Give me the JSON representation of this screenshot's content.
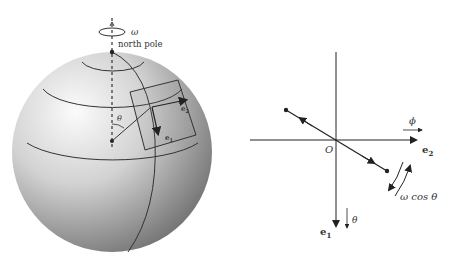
{
  "left_panel": {
    "rotation_label": "ω",
    "north_pole_label": "north pole",
    "theta_label": "θ",
    "e1_label": "e",
    "e1_sub": "1",
    "e2_label": "e",
    "e2_sub": "2"
  },
  "right_panel": {
    "origin_label": "O",
    "phi_label": "ϕ",
    "e2_label": "e",
    "e2_sub": "2",
    "e1_label": "e",
    "e1_sub": "1",
    "theta_label": "θ",
    "omega_cos_label": "ω cos θ"
  },
  "colors": {
    "stroke": "#222222",
    "sphere_light": "#f4f4f4",
    "sphere_dark": "#7a7a7a"
  }
}
